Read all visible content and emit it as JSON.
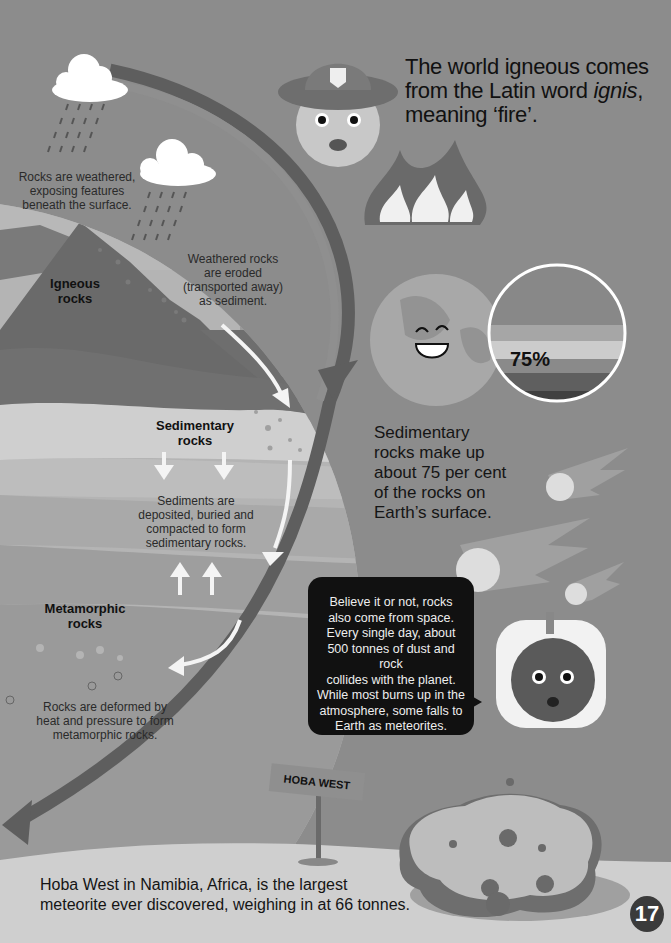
{
  "page_number": "17",
  "cycle": {
    "weathered_text": [
      "Rocks are weathered,",
      "exposing features",
      "beneath the surface."
    ],
    "eroded_text": [
      "Weathered rocks",
      "are eroded",
      "(transported away)",
      "as sediment."
    ],
    "igneous_label": [
      "Igneous",
      "rocks"
    ],
    "sedimentary_label": [
      "Sedimentary",
      "rocks"
    ],
    "deposited_text": [
      "Sediments are",
      "deposited, buried and",
      "compacted to form",
      "sedimentary rocks."
    ],
    "metamorphic_label": [
      "Metamorphic",
      "rocks"
    ],
    "deformed_text": [
      "Rocks are deformed by",
      "heat and pressure to form",
      "metamorphic rocks."
    ]
  },
  "facts": {
    "igneous_origin": {
      "line1": "The world igneous comes",
      "line2_prefix": "from the Latin word ",
      "line2_italic": "ignis",
      "line2_suffix": ",",
      "line3": "meaning ‘fire’."
    },
    "sedimentary_percent": {
      "value": "75%",
      "lines": [
        "Sedimentary",
        "rocks make up",
        "about 75 per cent",
        "of the rocks on",
        "Earth’s surface."
      ]
    },
    "space_rocks": {
      "lines": [
        "Believe it or not, rocks",
        "also come from space.",
        "Every single day, about",
        "500 tonnes of dust and rock",
        "collides with the planet.",
        "While most burns up in the",
        "atmosphere, some falls to",
        "Earth as meteorites."
      ]
    },
    "hoba_west": {
      "sign": "HOBA WEST",
      "lines": [
        "Hoba West in Namibia, Africa, is the largest",
        "meteorite ever discovered, weighing in at 66 tonnes."
      ]
    }
  },
  "icons": [
    "cloud-icon",
    "rain-icon",
    "firefighter-rock-character-icon",
    "fire-icon",
    "earth-character-icon",
    "meteor-icon",
    "astronaut-rock-character-icon",
    "meteorite-rock-icon",
    "signpost-icon"
  ]
}
